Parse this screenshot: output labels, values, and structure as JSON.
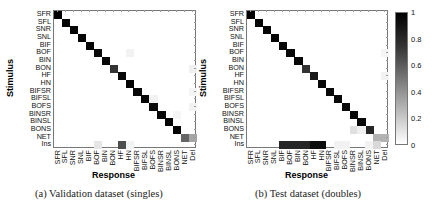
{
  "figure": {
    "panels": [
      {
        "id": "a",
        "caption": "(a)  Validation dataset (singles)"
      },
      {
        "id": "b",
        "caption": "(b)  Test dataset (doubles)"
      }
    ],
    "colorbar": {
      "ticks": [
        "1",
        "0.8",
        "0.6",
        "0.4",
        "0.2",
        "0"
      ],
      "min": 0,
      "max": 1
    }
  },
  "chart_data": [
    {
      "type": "heatmap",
      "title": "(a) Validation dataset (singles)",
      "xlabel": "Response",
      "ylabel": "Stimulus",
      "rows": [
        "SFR",
        "SFL",
        "SNR",
        "SNL",
        "BIF",
        "BOF",
        "BIN",
        "BON",
        "HF",
        "HN",
        "BIFSR",
        "BIFSL",
        "BOFS",
        "BINSR",
        "BINSL",
        "BONS",
        "NET",
        "Ins"
      ],
      "cols": [
        "SFR",
        "SFL",
        "SNR",
        "SNL",
        "BIF",
        "BOF",
        "BIN",
        "BON",
        "HF",
        "HN",
        "BIFSR",
        "BIFSL",
        "BOFS",
        "BINSR",
        "BINSL",
        "BONS",
        "NET",
        "Del"
      ],
      "diagonal": [
        1.0,
        0.98,
        0.98,
        0.98,
        0.98,
        0.96,
        0.97,
        0.8,
        0.97,
        0.98,
        0.97,
        0.97,
        0.96,
        0.97,
        0.98,
        0.98,
        0.6,
        null
      ],
      "off_diagonal": [
        {
          "row": "BOF",
          "col": "HN",
          "value": 0.05
        },
        {
          "row": "BON",
          "col": "Del",
          "value": 0.06
        },
        {
          "row": "BIFSR",
          "col": "Del",
          "value": 0.04
        },
        {
          "row": "BIFSL",
          "col": "BOFS",
          "value": 0.05
        },
        {
          "row": "BOFS",
          "col": "Del",
          "value": 0.05
        },
        {
          "row": "BINSR",
          "col": "BONS",
          "value": 0.04
        },
        {
          "row": "NET",
          "col": "Del",
          "value": 0.35
        },
        {
          "row": "Ins",
          "col": "BOF",
          "value": 0.1
        },
        {
          "row": "Ins",
          "col": "HF",
          "value": 0.7
        },
        {
          "row": "Ins",
          "col": "HN",
          "value": 0.05
        }
      ],
      "colorbar_range": [
        0,
        1
      ]
    },
    {
      "type": "heatmap",
      "title": "(b) Test dataset (doubles)",
      "xlabel": "Response",
      "ylabel": "Stimulus",
      "rows": [
        "SFR",
        "SFL",
        "SNR",
        "SNL",
        "BIF",
        "BOF",
        "BIN",
        "BON",
        "HF",
        "HN",
        "BIFSR",
        "BIFSL",
        "BOFS",
        "BINSR",
        "BINSL",
        "BONS",
        "NET",
        "Ins"
      ],
      "cols": [
        "SFR",
        "SFL",
        "SNR",
        "SNL",
        "BIF",
        "BOF",
        "BIN",
        "BON",
        "HF",
        "HN",
        "BIFSR",
        "BIFSL",
        "BOFS",
        "BINSR",
        "BINSL",
        "BONS",
        "NET",
        "Del"
      ],
      "diagonal": [
        1.0,
        0.98,
        0.98,
        0.98,
        0.97,
        0.97,
        0.97,
        0.8,
        0.9,
        0.97,
        0.97,
        0.97,
        0.96,
        0.97,
        0.97,
        0.85,
        0.3,
        null
      ],
      "off_diagonal": [
        {
          "row": "BOF",
          "col": "Del",
          "value": 0.04
        },
        {
          "row": "HF",
          "col": "Del",
          "value": 0.05
        },
        {
          "row": "BONS",
          "col": "BINSR",
          "value": 0.12
        },
        {
          "row": "BONS",
          "col": "BINSL",
          "value": 0.06
        },
        {
          "row": "NET",
          "col": "Del",
          "value": 0.3
        },
        {
          "row": "Ins",
          "col": "BIF",
          "value": 0.85
        },
        {
          "row": "Ins",
          "col": "BOF",
          "value": 0.85
        },
        {
          "row": "Ins",
          "col": "BIN",
          "value": 0.85
        },
        {
          "row": "Ins",
          "col": "BON",
          "value": 0.85
        },
        {
          "row": "Ins",
          "col": "HF",
          "value": 0.95
        },
        {
          "row": "Ins",
          "col": "HN",
          "value": 0.95
        },
        {
          "row": "Ins",
          "col": "BIFSL",
          "value": 0.05
        },
        {
          "row": "Ins",
          "col": "BOFS",
          "value": 0.05
        },
        {
          "row": "Ins",
          "col": "BONS",
          "value": 0.05
        },
        {
          "row": "Ins",
          "col": "NET",
          "value": 0.15
        }
      ],
      "colorbar_range": [
        0,
        1
      ]
    }
  ]
}
